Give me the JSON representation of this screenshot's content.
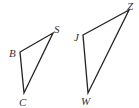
{
  "diagram": {
    "type": "geometry-triangles",
    "colors": {
      "stroke": "#222222",
      "label": "#333333",
      "background": "#ffffff"
    },
    "triangles": [
      {
        "name": "triangle-BSC",
        "vertices": [
          {
            "label": "B",
            "x": 20,
            "y": 52,
            "lx": 9,
            "ly": 57
          },
          {
            "label": "S",
            "x": 53,
            "y": 33,
            "lx": 54,
            "ly": 33
          },
          {
            "label": "C",
            "x": 24,
            "y": 93,
            "lx": 19,
            "ly": 106
          }
        ]
      },
      {
        "name": "triangle-JZW",
        "vertices": [
          {
            "label": "J",
            "x": 83,
            "y": 35,
            "lx": 74,
            "ly": 41
          },
          {
            "label": "Z",
            "x": 129,
            "y": 10,
            "lx": 127,
            "ly": 10
          },
          {
            "label": "W",
            "x": 88,
            "y": 93,
            "lx": 81,
            "ly": 105
          }
        ]
      }
    ]
  }
}
